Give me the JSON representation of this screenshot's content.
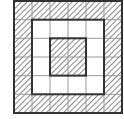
{
  "diagram": {
    "type": "nested-squares-grid",
    "grid_size": 6,
    "cells": [
      [
        1,
        1,
        1,
        1,
        1,
        1
      ],
      [
        1,
        0,
        0,
        0,
        0,
        1
      ],
      [
        1,
        0,
        1,
        1,
        0,
        1
      ],
      [
        1,
        0,
        1,
        1,
        0,
        1
      ],
      [
        1,
        0,
        0,
        0,
        0,
        1
      ],
      [
        1,
        1,
        1,
        1,
        1,
        1
      ]
    ],
    "legend": {
      "1": "hatched",
      "0": "white"
    },
    "colors": {
      "line": "#333333",
      "grid": "#9a9a9a",
      "hatch": "#555555",
      "background": "#ffffff"
    }
  }
}
